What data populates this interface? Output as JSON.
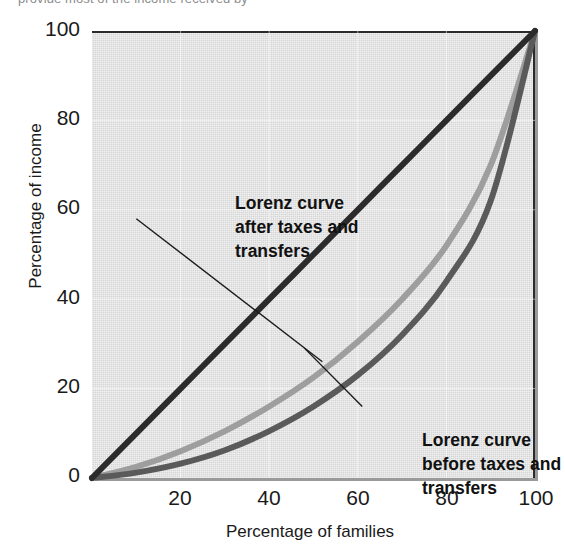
{
  "caption": {
    "partial_text": "provide most of the income received by"
  },
  "chart_data": {
    "type": "line",
    "title": "",
    "subtitle": "",
    "xlabel": "Percentage of families",
    "ylabel": "Percentage of income",
    "xlim": [
      0,
      100
    ],
    "ylim": [
      0,
      100
    ],
    "xticks": [
      "20",
      "40",
      "60",
      "80",
      "100"
    ],
    "xtick_values": [
      20,
      40,
      60,
      80,
      100
    ],
    "yticks": [
      "0",
      "20",
      "40",
      "60",
      "80",
      "100"
    ],
    "ytick_values": [
      0,
      20,
      40,
      60,
      80,
      100
    ],
    "grid": true,
    "grid_color": "#ffffff",
    "plot_background": "#d6d6d6",
    "legend_position": "none",
    "x": [
      0,
      10,
      20,
      30,
      40,
      50,
      60,
      70,
      80,
      90,
      100
    ],
    "series": [
      {
        "name": "Line of equality",
        "color": "#2b2b2b",
        "linewidth": 6,
        "values": [
          0,
          10,
          20,
          30,
          40,
          50,
          60,
          70,
          80,
          90,
          100
        ]
      },
      {
        "name": "Lorenz curve after taxes and transfers",
        "color": "#9e9e9e",
        "linewidth": 6,
        "values": [
          0,
          2.5,
          6,
          10.5,
          16,
          22.5,
          30.5,
          40,
          52,
          70,
          100
        ]
      },
      {
        "name": "Lorenz curve before taxes and transfers",
        "color": "#5a5a5a",
        "linewidth": 6,
        "values": [
          0,
          1.2,
          3.2,
          6.2,
          10.5,
          16,
          23,
          32,
          44,
          62,
          100
        ]
      }
    ],
    "annotations": [
      {
        "id": "after",
        "lines": [
          "Lorenz curve",
          "after taxes and",
          "transfers"
        ],
        "target_series": "Lorenz curve after taxes and transfers",
        "leader_from": [
          10,
          58
        ],
        "leader_to": [
          52,
          26
        ]
      },
      {
        "id": "before",
        "lines": [
          "Lorenz curve",
          "before taxes and",
          "transfers"
        ],
        "target_series": "Lorenz curve before taxes and transfers",
        "leader_from": [
          61,
          16
        ],
        "leader_to": [
          48,
          29
        ]
      }
    ]
  }
}
